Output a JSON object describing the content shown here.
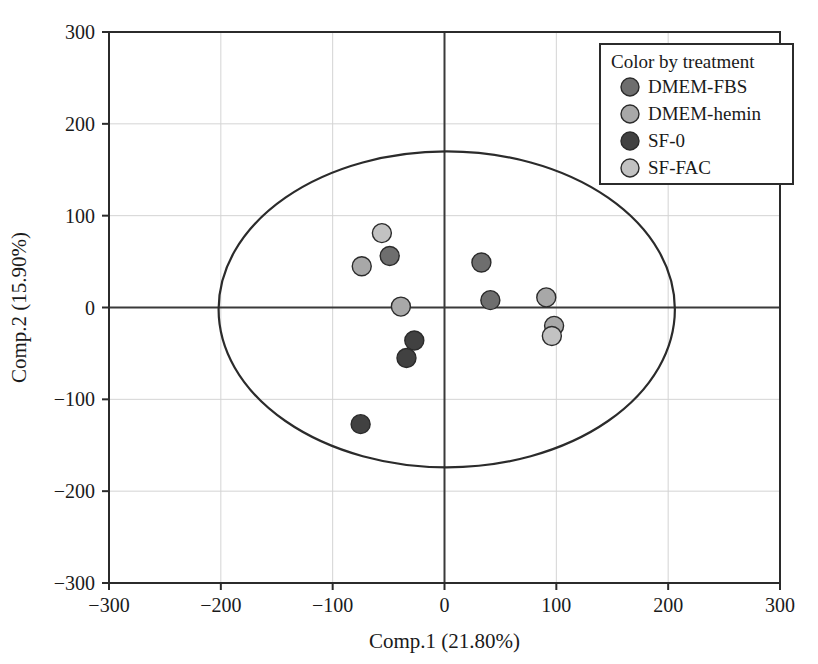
{
  "chart_data": {
    "type": "scatter",
    "title": "",
    "xlabel": "Comp.1 (21.80%)",
    "ylabel": "Comp.2 (15.90%)",
    "xlim": [
      -300,
      300
    ],
    "ylim": [
      -300,
      300
    ],
    "xticks": [
      -300,
      -200,
      -100,
      0,
      100,
      200,
      300
    ],
    "yticks": [
      -300,
      -200,
      -100,
      0,
      100,
      200,
      300
    ],
    "xtick_labels": [
      "−300",
      "−200",
      "−100",
      "0",
      "100",
      "200",
      "300"
    ],
    "ytick_labels": [
      "−300",
      "−200",
      "−100",
      "0",
      "100",
      "200",
      "300"
    ],
    "grid": true,
    "legend_position": "top-right",
    "legend_title": "Color by treatment",
    "series": [
      {
        "name": "DMEM-FBS",
        "color": "#6e6e6e",
        "points": [
          {
            "x": -49,
            "y": 56
          },
          {
            "x": 33,
            "y": 49
          },
          {
            "x": 41,
            "y": 8
          }
        ]
      },
      {
        "name": "DMEM-hemin",
        "color": "#a8a8a8",
        "points": [
          {
            "x": -74,
            "y": 45
          },
          {
            "x": -39,
            "y": 1
          },
          {
            "x": 91,
            "y": 11
          },
          {
            "x": 98,
            "y": -20
          }
        ]
      },
      {
        "name": "SF-0",
        "color": "#414141",
        "points": [
          {
            "x": -27,
            "y": -36
          },
          {
            "x": -34,
            "y": -55
          },
          {
            "x": -75,
            "y": -127
          }
        ]
      },
      {
        "name": "SF-FAC",
        "color": "#c2c2c2",
        "points": [
          {
            "x": -56,
            "y": 81
          },
          {
            "x": 96,
            "y": -31
          }
        ]
      }
    ],
    "ellipse": {
      "center_x": 2,
      "center_y": -2,
      "radius_x": 204,
      "radius_y": 172,
      "color": "#2b2b2b"
    }
  },
  "axis": {
    "zero_line_color": "#3a3a3a",
    "grid_color": "#d4d4d4",
    "frame_color": "#2b2b2b"
  }
}
